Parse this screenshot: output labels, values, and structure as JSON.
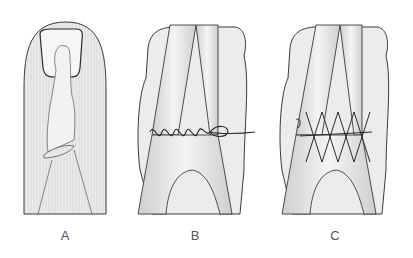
{
  "figure": {
    "panels": [
      {
        "id": "A",
        "label": "A",
        "description": "finger dorsal view with nail outline and underlying tendon/bone"
      },
      {
        "id": "B",
        "label": "B",
        "description": "tendon repair with running/continuous suture"
      },
      {
        "id": "C",
        "label": "C",
        "description": "tendon repair with figure-of-eight cross-stitch suture"
      }
    ],
    "colors": {
      "outline": "#3a3a3a",
      "fill": "#e9e9e9",
      "shade": "#d4d4d4",
      "suture": "#2a2a2a",
      "label": "#555555"
    }
  }
}
